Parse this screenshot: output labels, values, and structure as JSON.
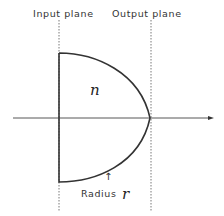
{
  "labels": {
    "input_plane": "Input plane",
    "output_plane": "Output plane",
    "refractive_index": "n",
    "radius_label": "Radius",
    "radius_symbol": "r",
    "radius_arrow": "↑"
  },
  "colors": {
    "stroke": "#333333",
    "dashed": "#555555",
    "axis": "#444444",
    "background": "#ffffff"
  }
}
